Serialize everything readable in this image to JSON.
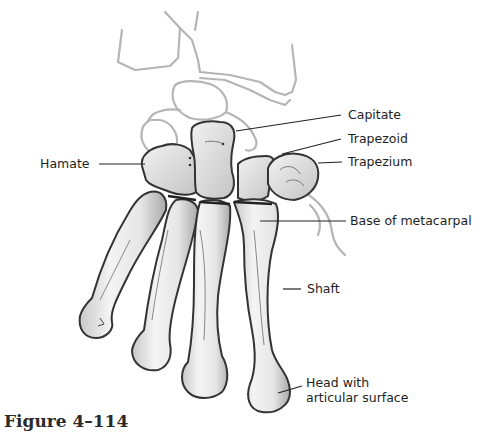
{
  "figure": {
    "caption": "Figure 4–114"
  },
  "labels": {
    "capitate": "Capitate",
    "trapezoid": "Trapezoid",
    "trapezium": "Trapezium",
    "hamate": "Hamate",
    "base_of_metacarpal": "Base of metacarpal",
    "shaft": "Shaft",
    "head_line1": "Head with",
    "head_line2": "articular surface"
  },
  "colors": {
    "bone_fill": "#ececec",
    "bone_outline": "#3a3a3a",
    "bone_shade": "#b8b8b8",
    "faint_outline": "#b5b5b5",
    "leader_line": "#222222",
    "text": "#1e1e1e"
  }
}
